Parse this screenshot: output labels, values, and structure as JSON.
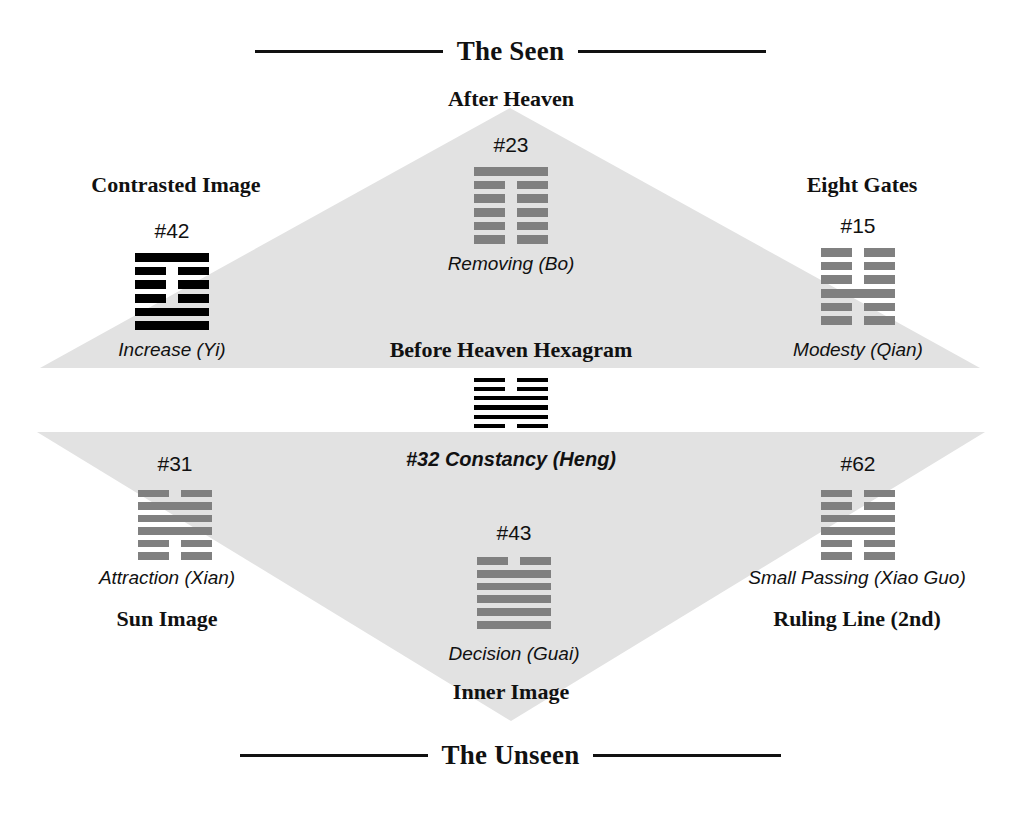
{
  "banners": {
    "top": "The Seen",
    "bottom": "The Unseen"
  },
  "headings": {
    "after_heaven": "After Heaven",
    "before_heaven": "Before Heaven Hexagram",
    "contrasted_image": "Contrasted Image",
    "eight_gates": "Eight Gates",
    "sun_image": "Sun Image",
    "ruling_line": "Ruling Line (2nd)",
    "inner_image": "Inner Image"
  },
  "center_hexagram": {
    "label": "#32 Constancy (Heng)",
    "number": "#32",
    "name": "Constancy (Heng)",
    "color": "#000000",
    "lines_top_down": [
      "broken",
      "broken",
      "solid",
      "solid",
      "solid",
      "broken"
    ]
  },
  "hexagrams": [
    {
      "id": "after-heaven",
      "number": "#23",
      "name": "Removing (Bo)",
      "color": "#808080",
      "lines_top_down": [
        "solid",
        "broken",
        "broken",
        "broken",
        "broken",
        "broken"
      ]
    },
    {
      "id": "contrasted-image",
      "number": "#42",
      "name": "Increase (Yi)",
      "color": "#000000",
      "lines_top_down": [
        "solid",
        "broken",
        "broken",
        "broken",
        "solid",
        "solid"
      ]
    },
    {
      "id": "eight-gates",
      "number": "#15",
      "name": "Modesty (Qian)",
      "color": "#808080",
      "lines_top_down": [
        "broken",
        "broken",
        "broken",
        "solid",
        "broken",
        "broken"
      ]
    },
    {
      "id": "sun-image",
      "number": "#31",
      "name": "Attraction (Xian)",
      "color": "#808080",
      "lines_top_down": [
        "broken",
        "solid",
        "solid",
        "solid",
        "broken",
        "broken"
      ]
    },
    {
      "id": "ruling-line",
      "number": "#62",
      "name": "Small Passing (Xiao Guo)",
      "color": "#808080",
      "lines_top_down": [
        "broken",
        "broken",
        "solid",
        "solid",
        "broken",
        "broken"
      ]
    },
    {
      "id": "inner-image",
      "number": "#43",
      "name": "Decision (Guai)",
      "color": "#808080",
      "lines_top_down": [
        "broken",
        "solid",
        "solid",
        "solid",
        "solid",
        "solid"
      ]
    }
  ],
  "colors": {
    "triangle_fill": "#e2e2e2",
    "ink": "#111111"
  }
}
